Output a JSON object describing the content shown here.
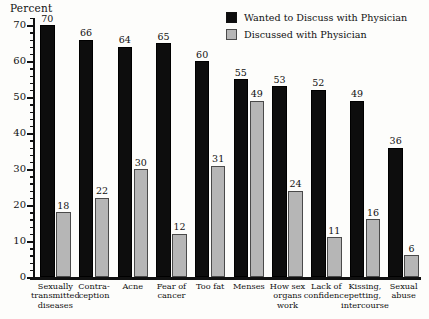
{
  "chart_data": {
    "type": "bar",
    "title": "",
    "xlabel": "",
    "ylabel": "Percent",
    "ylim": [
      0,
      72
    ],
    "ytick_step": 10,
    "yticks": [
      0,
      10,
      20,
      30,
      40,
      50,
      60,
      70
    ],
    "grid": false,
    "legend_position": "top-right",
    "categories": [
      "Sexually transmitted diseases",
      "Contraception",
      "Acne",
      "Fear of cancer",
      "Too fat",
      "Menses",
      "How sex organs work",
      "Lack of confidence",
      "Kissing, petting, intercourse",
      "Sexual abuse"
    ],
    "category_lines": [
      [
        "Sexually",
        "transmitted",
        "diseases"
      ],
      [
        "Contra-",
        "ception"
      ],
      [
        "Acne"
      ],
      [
        "Fear of",
        "cancer"
      ],
      [
        "Too fat"
      ],
      [
        "Menses"
      ],
      [
        "How sex",
        "organs",
        "work"
      ],
      [
        "Lack of",
        "confidence"
      ],
      [
        "Kissing,",
        "petting,",
        "intercourse"
      ],
      [
        "Sexual",
        "abuse"
      ]
    ],
    "series": [
      {
        "name": "Wanted to Discuss with Physician",
        "color": "#0d0d0d",
        "values": [
          70,
          66,
          64,
          65,
          60,
          55,
          53,
          52,
          49,
          36
        ]
      },
      {
        "name": "Discussed with Physician",
        "color": "#b6b6b6",
        "values": [
          18,
          22,
          30,
          12,
          31,
          49,
          24,
          11,
          16,
          6
        ]
      }
    ]
  },
  "legend": {
    "items": [
      {
        "label": "Wanted to Discuss with Physician",
        "swatch": "dark"
      },
      {
        "label": "Discussed with Physician",
        "swatch": "light"
      }
    ]
  },
  "axis": {
    "y_title": "Percent"
  }
}
